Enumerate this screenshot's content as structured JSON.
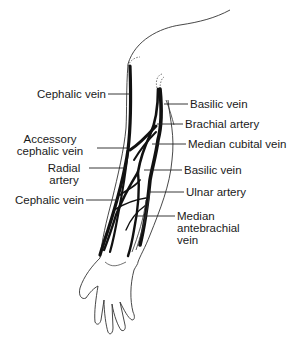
{
  "diagram": {
    "labels_left": [
      {
        "id": "cephalic-vein-upper",
        "lines": [
          "Cephalic vein"
        ]
      },
      {
        "id": "accessory-cephalic-vein",
        "lines": [
          "Accessory",
          "cephalic vein"
        ]
      },
      {
        "id": "radial-artery",
        "lines": [
          "Radial",
          "artery"
        ]
      },
      {
        "id": "cephalic-vein-lower",
        "lines": [
          "Cephalic vein"
        ]
      }
    ],
    "labels_right": [
      {
        "id": "basilic-vein-upper",
        "lines": [
          "Basilic vein"
        ]
      },
      {
        "id": "brachial-artery",
        "lines": [
          "Brachial artery"
        ]
      },
      {
        "id": "median-cubital-vein",
        "lines": [
          "Median cubital vein"
        ]
      },
      {
        "id": "basilic-vein-lower",
        "lines": [
          "Basilic vein"
        ]
      },
      {
        "id": "ulnar-artery",
        "lines": [
          "Ulnar artery"
        ]
      },
      {
        "id": "median-antebrachial-vein",
        "lines": [
          "Median",
          "antebrachial",
          "vein"
        ]
      }
    ],
    "colors": {
      "vessel": "#111111",
      "outline": "#333333",
      "text": "#1a1a1a",
      "background": "#ffffff"
    }
  }
}
